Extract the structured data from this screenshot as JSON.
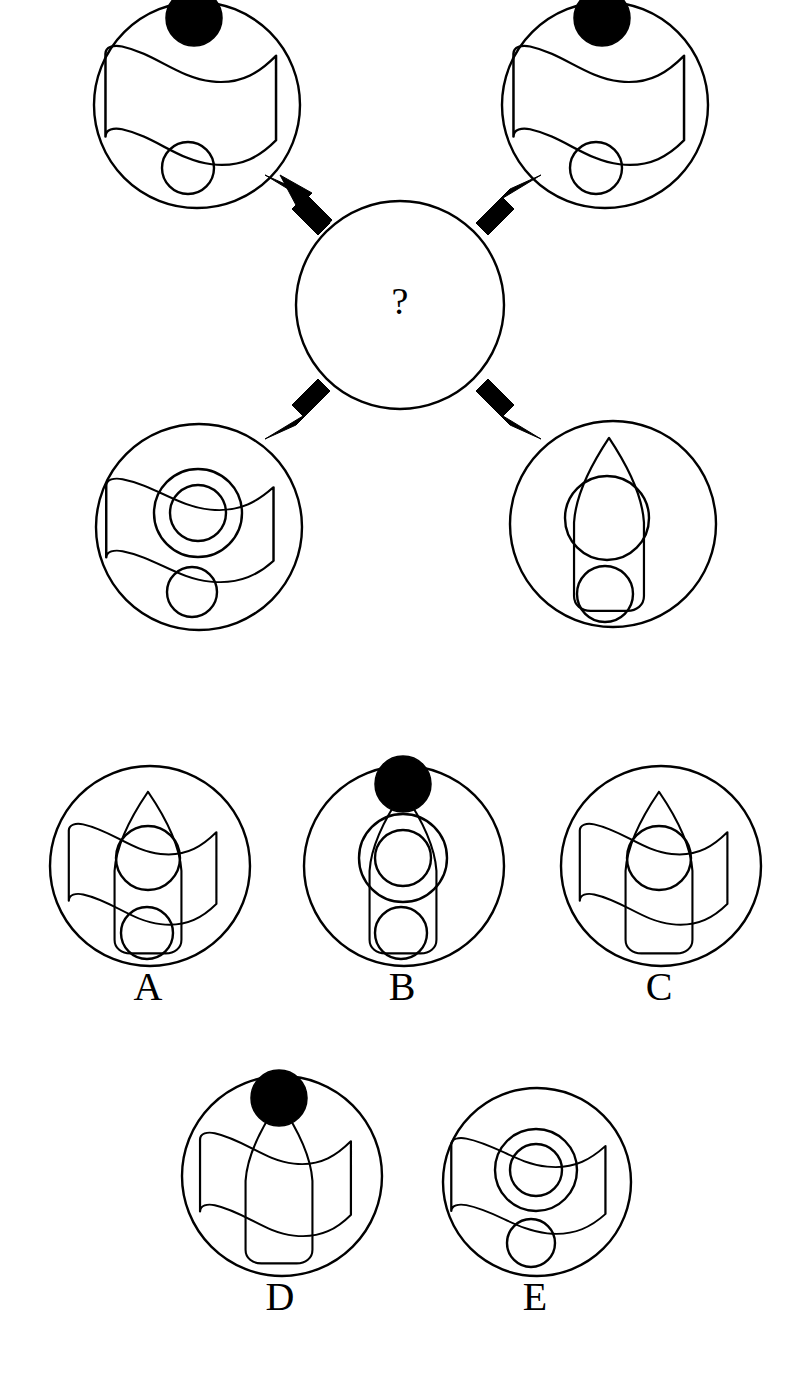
{
  "puzzle": {
    "type": "visual-analogy-matrix",
    "center_symbol": "?",
    "palette": {
      "background": "#ffffff",
      "stroke": "#000000",
      "fill_dot": "#000000"
    },
    "source_panels": [
      {
        "id": "top-left",
        "position": "top-left",
        "cx": 197,
        "cy": 105,
        "r": 103,
        "components": [
          "black-dot-top",
          "wavy-flag",
          "small-circle-bottom"
        ],
        "has_black_dot": true,
        "has_rocket": false,
        "has_flag": true,
        "has_inner_circle": false,
        "has_concentric_circle": false,
        "has_bottom_circle": true
      },
      {
        "id": "top-right",
        "position": "top-right",
        "cx": 605,
        "cy": 105,
        "r": 103,
        "components": [
          "black-dot-top",
          "wavy-flag",
          "small-circle-bottom"
        ],
        "has_black_dot": true,
        "has_rocket": false,
        "has_flag": true,
        "has_inner_circle": false,
        "has_concentric_circle": false,
        "has_bottom_circle": true
      },
      {
        "id": "bottom-left",
        "position": "bottom-left",
        "cx": 199,
        "cy": 527,
        "r": 103,
        "components": [
          "wavy-flag",
          "concentric-circles-center",
          "small-circle-bottom"
        ],
        "has_black_dot": false,
        "has_rocket": false,
        "has_flag": true,
        "has_inner_circle": true,
        "has_concentric_circle": true,
        "has_bottom_circle": true
      },
      {
        "id": "bottom-right",
        "position": "bottom-right",
        "cx": 613,
        "cy": 524,
        "r": 103,
        "components": [
          "rocket-body",
          "inner-circle",
          "small-circle-bottom"
        ],
        "has_black_dot": false,
        "has_rocket": true,
        "has_flag": false,
        "has_inner_circle": true,
        "has_concentric_circle": false,
        "has_bottom_circle": true
      }
    ],
    "center_panel": {
      "id": "center-unknown",
      "cx": 400,
      "cy": 305,
      "r": 104,
      "label": "?"
    },
    "arrows": [
      {
        "id": "arrow-to-top-left",
        "from": "center",
        "to": "top-left",
        "direction": "up-left"
      },
      {
        "id": "arrow-to-top-right",
        "from": "center",
        "to": "top-right",
        "direction": "up-right"
      },
      {
        "id": "arrow-to-bottom-left",
        "from": "center",
        "to": "bottom-left",
        "direction": "down-left"
      },
      {
        "id": "arrow-to-bottom-right",
        "from": "center",
        "to": "bottom-right",
        "direction": "down-right"
      }
    ],
    "options": [
      {
        "label": "A",
        "cx": 150,
        "cy": 866,
        "r": 100,
        "label_x": 148,
        "label_y": 1000,
        "components": [
          "rocket-body",
          "wavy-flag",
          "inner-circle",
          "small-circle-bottom"
        ],
        "has_black_dot": false,
        "has_rocket": true,
        "has_flag": true,
        "has_inner_circle": true,
        "has_concentric_circle": false,
        "has_bottom_circle": true
      },
      {
        "label": "B",
        "cx": 404,
        "cy": 866,
        "r": 100,
        "label_x": 402,
        "label_y": 1000,
        "components": [
          "black-dot-top",
          "rocket-body",
          "concentric-circles-center",
          "small-circle-bottom"
        ],
        "has_black_dot": true,
        "has_rocket": true,
        "has_flag": false,
        "has_inner_circle": true,
        "has_concentric_circle": true,
        "has_bottom_circle": true
      },
      {
        "label": "C",
        "cx": 661,
        "cy": 866,
        "r": 100,
        "label_x": 659,
        "label_y": 1000,
        "components": [
          "rocket-body",
          "wavy-flag",
          "inner-circle"
        ],
        "has_black_dot": false,
        "has_rocket": true,
        "has_flag": true,
        "has_inner_circle": true,
        "has_concentric_circle": false,
        "has_bottom_circle": false
      },
      {
        "label": "D",
        "cx": 282,
        "cy": 1176,
        "r": 100,
        "label_x": 280,
        "label_y": 1310,
        "components": [
          "black-dot-top",
          "rocket-body",
          "wavy-flag"
        ],
        "has_black_dot": true,
        "has_rocket": true,
        "has_flag": true,
        "has_inner_circle": false,
        "has_concentric_circle": false,
        "has_bottom_circle": false
      },
      {
        "label": "E",
        "cx": 537,
        "cy": 1182,
        "r": 94,
        "label_x": 535,
        "label_y": 1310,
        "components": [
          "wavy-flag",
          "concentric-circles-center",
          "small-circle-bottom"
        ],
        "has_black_dot": false,
        "has_rocket": false,
        "has_flag": true,
        "has_inner_circle": true,
        "has_concentric_circle": true,
        "has_bottom_circle": true
      }
    ]
  }
}
